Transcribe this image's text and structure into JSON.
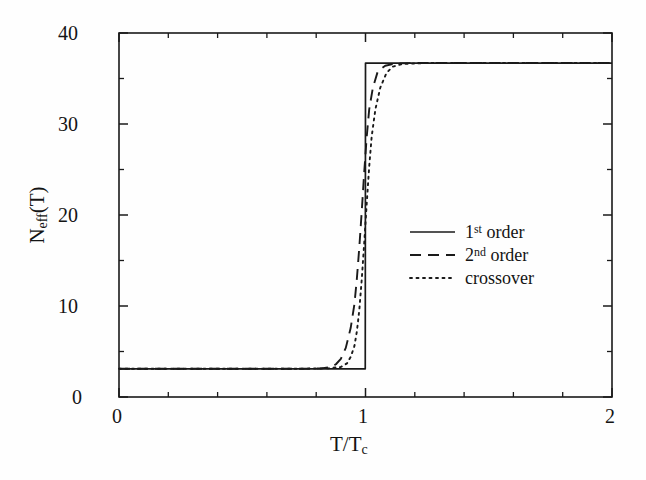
{
  "chart_data": {
    "type": "line",
    "title": "",
    "xlabel": "T/T_c",
    "ylabel": "N_eff(T)",
    "xlim": [
      0,
      2
    ],
    "ylim": [
      0,
      40
    ],
    "grid": false,
    "legend_position": "center-right",
    "xticks": [
      0,
      1,
      2
    ],
    "xtick_labels": [
      "0",
      "1",
      "2"
    ],
    "xminor_step": 0.2,
    "yticks": [
      0,
      10,
      20,
      30,
      40
    ],
    "ytick_labels": [
      "0",
      "10",
      "20",
      "30",
      "40"
    ],
    "yminor_step": 5,
    "low_plateau": 3.1,
    "high_plateau": 36.7,
    "transition_x": 1.0,
    "series": [
      {
        "name": "1st order",
        "style": "solid",
        "points": [
          [
            0.0,
            3.1
          ],
          [
            0.2,
            3.1
          ],
          [
            0.4,
            3.1
          ],
          [
            0.6,
            3.1
          ],
          [
            0.8,
            3.1
          ],
          [
            0.9,
            3.1
          ],
          [
            0.96,
            3.1
          ],
          [
            0.999,
            3.1
          ],
          [
            1.0,
            36.7
          ],
          [
            1.1,
            36.7
          ],
          [
            1.3,
            36.7
          ],
          [
            1.6,
            36.7
          ],
          [
            2.0,
            36.7
          ]
        ]
      },
      {
        "name": "2nd order",
        "style": "dashed",
        "points": [
          [
            0.0,
            3.1
          ],
          [
            0.3,
            3.1
          ],
          [
            0.6,
            3.1
          ],
          [
            0.75,
            3.1
          ],
          [
            0.82,
            3.15
          ],
          [
            0.86,
            3.3
          ],
          [
            0.88,
            3.6
          ],
          [
            0.9,
            4.2
          ],
          [
            0.92,
            5.4
          ],
          [
            0.94,
            7.6
          ],
          [
            0.955,
            10.2
          ],
          [
            0.965,
            13.0
          ],
          [
            0.975,
            16.5
          ],
          [
            0.985,
            20.5
          ],
          [
            0.995,
            24.8
          ],
          [
            1.005,
            28.6
          ],
          [
            1.015,
            31.6
          ],
          [
            1.03,
            34.0
          ],
          [
            1.05,
            35.8
          ],
          [
            1.08,
            36.4
          ],
          [
            1.12,
            36.65
          ],
          [
            1.2,
            36.7
          ],
          [
            1.5,
            36.7
          ],
          [
            2.0,
            36.7
          ]
        ]
      },
      {
        "name": "crossover",
        "style": "dotted",
        "points": [
          [
            0.0,
            3.1
          ],
          [
            0.4,
            3.1
          ],
          [
            0.7,
            3.1
          ],
          [
            0.85,
            3.15
          ],
          [
            0.9,
            3.3
          ],
          [
            0.925,
            3.7
          ],
          [
            0.94,
            4.4
          ],
          [
            0.955,
            5.6
          ],
          [
            0.965,
            7.2
          ],
          [
            0.975,
            9.6
          ],
          [
            0.985,
            13.0
          ],
          [
            0.995,
            17.0
          ],
          [
            1.005,
            21.3
          ],
          [
            1.015,
            25.3
          ],
          [
            1.025,
            28.6
          ],
          [
            1.04,
            31.6
          ],
          [
            1.06,
            34.0
          ],
          [
            1.085,
            35.6
          ],
          [
            1.11,
            36.3
          ],
          [
            1.15,
            36.6
          ],
          [
            1.25,
            36.7
          ],
          [
            1.6,
            36.7
          ],
          [
            2.0,
            36.7
          ]
        ]
      }
    ]
  },
  "axes": {
    "y_title_main": "N",
    "y_title_sub": "eff",
    "y_title_tail": "(T)",
    "x_title_main": "T/T",
    "x_title_sub": "c",
    "x_tick_0": "0",
    "x_tick_1": "1",
    "x_tick_2": "2",
    "y_tick_0": "0",
    "y_tick_10": "10",
    "y_tick_20": "20",
    "y_tick_30": "30",
    "y_tick_40": "40"
  },
  "legend": {
    "entries": [
      {
        "num": "1",
        "ord": "st",
        "word": "order",
        "style": "solid"
      },
      {
        "num": "2",
        "ord": "nd",
        "word": "order",
        "style": "dashed"
      },
      {
        "num": "",
        "ord": "",
        "word": "crossover",
        "style": "dotted"
      }
    ],
    "item_1_num": "1",
    "item_1_ord": "st",
    "item_1_word": "order",
    "item_2_num": "2",
    "item_2_ord": "nd",
    "item_2_word": "order",
    "item_3_word": "crossover"
  },
  "colors": {
    "line": "#1a1a1a",
    "axis": "#1a1a1a",
    "background": "#fefefe",
    "text": "#141414"
  }
}
